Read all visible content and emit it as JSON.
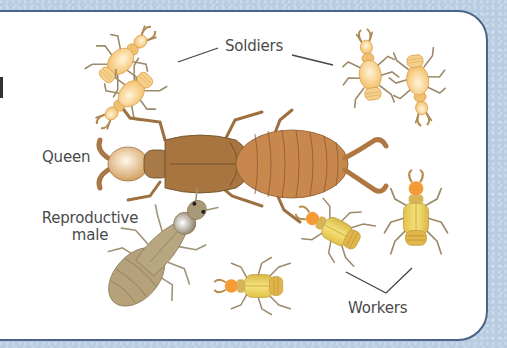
{
  "diagram": {
    "labels": {
      "soldiers": "Soldiers",
      "queen": "Queen",
      "reproductive_male_line1": "Reproductive",
      "reproductive_male_line2": "male",
      "workers": "Workers"
    },
    "castes": [
      {
        "name": "Soldiers",
        "count": 4,
        "body_color": "#f6c978",
        "head_color": "#f0b050"
      },
      {
        "name": "Queen",
        "count": 1,
        "thorax_color": "#a8743e",
        "abdomen_color": "#c8874c",
        "head_color": "#e9c48c"
      },
      {
        "name": "Reproductive male",
        "count": 1,
        "body_color": "#b5a27a",
        "head_color": "#a89a78"
      },
      {
        "name": "Workers",
        "count": 3,
        "body_color": "#e6cc50",
        "head_color": "#f5952f"
      }
    ],
    "colors": {
      "background": "#b9cde2",
      "card": "#ffffff",
      "border": "#4a6487",
      "text": "#4a4a4a",
      "leader_line": "#444444"
    }
  }
}
